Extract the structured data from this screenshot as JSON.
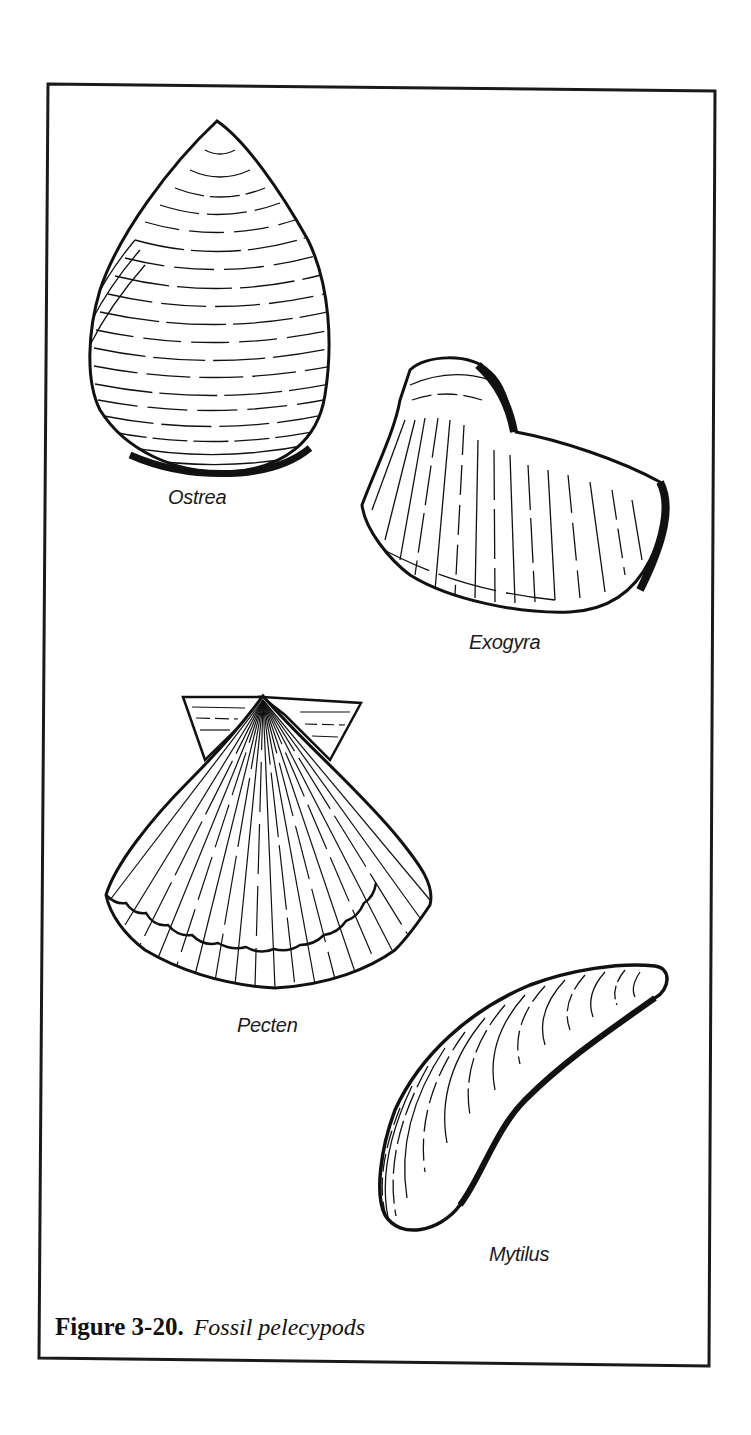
{
  "figure": {
    "number_label": "Figure 3-20.",
    "title": "Fossil pelecypods"
  },
  "specimens": [
    {
      "name": "Ostrea"
    },
    {
      "name": "Exogyra"
    },
    {
      "name": "Pecten"
    },
    {
      "name": "Mytilus"
    }
  ],
  "colors": {
    "ink": "#111111",
    "paper": "#ffffff"
  }
}
